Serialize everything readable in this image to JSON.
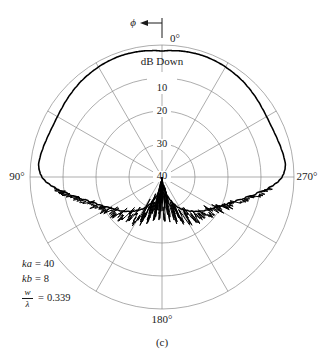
{
  "figure": {
    "caption": "(c)",
    "angle_unit": "deg"
  },
  "axes": {
    "angular_labels": [
      {
        "label": "0°",
        "angle": 0
      },
      {
        "label": "90°",
        "angle": 90
      },
      {
        "label": "180°",
        "angle": 180
      },
      {
        "label": "270°",
        "angle": 270
      }
    ],
    "radial_axis_title": "dB Down",
    "radial_ticks": [
      "10",
      "20",
      "30",
      "40"
    ],
    "phi_symbol": "ϕ",
    "phi_arrow_direction": "left"
  },
  "parameters": [
    {
      "symbol": "ka",
      "equals": "=",
      "value": "40"
    },
    {
      "symbol": "kb",
      "equals": "=",
      "value": "8"
    },
    {
      "symbol_numerator": "w",
      "symbol_denominator": "λ",
      "equals": "=",
      "value": "0.339"
    }
  ],
  "colors": {
    "grid": "#8a8a8a",
    "curve": "#000000",
    "text": "#1a1a1a",
    "background": "#ffffff"
  },
  "chart_data": {
    "type": "line",
    "plot_style": "polar",
    "title": "",
    "subtitle": "",
    "xlabel": "",
    "ylabel": "dB Down",
    "legend": [],
    "grid": true,
    "angular_range_deg": [
      0,
      360
    ],
    "angular_tick_step_deg": 30,
    "radial_range_db_down": [
      0,
      40
    ],
    "radial_tick_step_db": 10,
    "radial_ticks_db": [
      0,
      10,
      20,
      30,
      40
    ],
    "radial_axis_inverted": true,
    "annotations": [
      "ka = 40",
      "kb = 8",
      "w/λ = 0.339",
      "(c)"
    ],
    "series": [
      {
        "name": "radiation-pattern",
        "angles_deg": [
          0,
          4,
          8,
          12,
          16,
          20,
          24,
          28,
          32,
          36,
          40,
          44,
          48,
          52,
          56,
          60,
          64,
          68,
          72,
          76,
          80,
          84,
          86,
          88,
          90,
          92,
          94,
          96,
          100,
          104,
          108,
          112,
          116,
          120,
          124,
          128,
          132,
          136,
          140,
          144,
          148,
          152,
          156,
          160,
          164,
          168,
          172,
          176,
          180,
          184,
          188,
          192,
          196,
          200,
          204,
          208,
          212,
          216,
          220,
          224,
          228,
          232,
          236,
          240,
          244,
          248,
          252,
          256,
          260,
          264,
          266,
          268,
          270,
          272,
          274,
          276,
          280,
          284,
          288,
          292,
          296,
          300,
          304,
          308,
          312,
          316,
          320,
          324,
          328,
          332,
          336,
          340,
          344,
          348,
          352,
          356
        ],
        "values_db_down": [
          1.8,
          1.6,
          1.4,
          1.3,
          1.2,
          1.2,
          1.3,
          1.4,
          1.6,
          1.8,
          2.0,
          2.3,
          2.6,
          2.9,
          3.2,
          3.4,
          3.5,
          3.4,
          3.2,
          2.9,
          2.6,
          2.4,
          2.6,
          3.0,
          3.6,
          4.6,
          6.0,
          7.6,
          11.0,
          14.0,
          16.5,
          18.5,
          20.0,
          21.5,
          22.5,
          23.5,
          24.5,
          25.5,
          26.5,
          27.5,
          28.5,
          29.5,
          31.0,
          32.5,
          34.0,
          35.5,
          37.0,
          38.5,
          39.5,
          38.5,
          37.0,
          35.5,
          34.0,
          32.5,
          31.0,
          29.5,
          28.5,
          27.5,
          26.5,
          25.5,
          24.5,
          23.5,
          22.5,
          21.5,
          20.0,
          18.5,
          16.5,
          14.0,
          11.0,
          7.6,
          6.0,
          4.6,
          3.6,
          3.0,
          2.6,
          2.4,
          2.6,
          2.9,
          3.2,
          3.4,
          3.5,
          3.4,
          3.2,
          2.9,
          2.6,
          2.3,
          2.0,
          1.8,
          1.6,
          1.4,
          1.3,
          1.2,
          1.2,
          1.3,
          1.4,
          1.6
        ]
      }
    ]
  }
}
